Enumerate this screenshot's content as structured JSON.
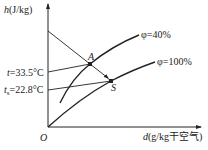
{
  "diagram": {
    "type": "psychrometric-h-d-chart",
    "y_axis": {
      "symbol": "h",
      "unit": "(J/kg)"
    },
    "x_axis": {
      "symbol": "d",
      "unit": "(g/kg干空气)"
    },
    "origin_label": "O",
    "curves": [
      {
        "id": "phi40",
        "symbol": "φ",
        "label": "=40%"
      },
      {
        "id": "phi100",
        "symbol": "φ",
        "label": "=100%"
      }
    ],
    "points": [
      {
        "id": "A",
        "label": "A"
      },
      {
        "id": "S",
        "label": "S"
      }
    ],
    "temperature_lines": [
      {
        "id": "t",
        "symbol": "t",
        "subscript": "",
        "value": "=33.5°C"
      },
      {
        "id": "ts",
        "symbol": "t",
        "subscript": "s",
        "value": "=22.8°C"
      }
    ],
    "colors": {
      "line": "#222222",
      "background": "#ffffff"
    }
  }
}
